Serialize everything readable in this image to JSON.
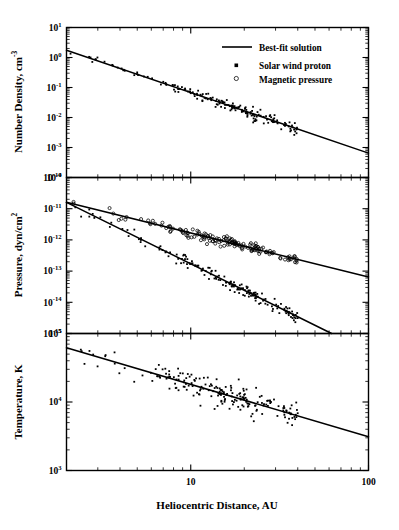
{
  "figure": {
    "title": "",
    "background_color": "#ffffff",
    "ink_color": "#000000"
  },
  "xaxis": {
    "label": "Heliocentric Distance,  AU",
    "scale": "log",
    "min": 2,
    "max": 100,
    "tick_labels": [
      "10",
      "100"
    ],
    "tick_values": [
      10,
      100
    ],
    "minor_ticks": [
      2,
      3,
      4,
      5,
      6,
      7,
      8,
      9,
      20,
      30,
      40,
      50,
      60,
      70,
      80,
      90
    ]
  },
  "legend": {
    "position": "top-right panel 1",
    "items": [
      {
        "label": "Best-fit solution",
        "marker": "line"
      },
      {
        "label": "Solar wind proton",
        "marker": "filled-square"
      },
      {
        "label": "Magnetic pressure",
        "marker": "open-circle"
      }
    ]
  },
  "chart_data": [
    {
      "type": "scatter",
      "panel": 1,
      "title": "",
      "xlabel": "Heliocentric Distance,  AU",
      "ylabel": "Number Density,  cm",
      "ylabel_sup": "-3",
      "xscale": "log",
      "yscale": "log",
      "xlim": [
        2,
        100
      ],
      "ylim": [
        0.0001,
        10
      ],
      "ytick_labels": [
        "10",
        "10",
        "10",
        "10",
        "10",
        "10"
      ],
      "ytick_sups": [
        "1",
        "0",
        "-1",
        "-2",
        "-3",
        "-4"
      ],
      "ytick_values": [
        10,
        1,
        0.1,
        0.01,
        0.001,
        0.0001
      ],
      "grid": false,
      "series": [
        {
          "name": "Best-fit solution",
          "type": "line",
          "x": [
            2,
            100
          ],
          "y": [
            1.75,
            0.00065
          ]
        },
        {
          "name": "Solar wind proton",
          "type": "scatter",
          "marker": "filled-square",
          "x": [
            2.1,
            2.4,
            2.5,
            3.0,
            3.3,
            3.5,
            3.8,
            4.0,
            4.2,
            4.4,
            4.6,
            4.8,
            5.0,
            5.2,
            5.4,
            5.6,
            5.8,
            6.0,
            6.2,
            6.4,
            6.6,
            6.8,
            7.0,
            7.2,
            7.4,
            7.6,
            7.8,
            8.0,
            8.2,
            8.5,
            8.8,
            9.0,
            9.2,
            9.5,
            9.8,
            10.0,
            10.3,
            10.6,
            10.9,
            11.2,
            11.5,
            11.8,
            12.1,
            12.4,
            12.7,
            13.0,
            13.4,
            13.8,
            14.2,
            14.6,
            15.0,
            15.4,
            15.8,
            16.2,
            16.6,
            17.0,
            17.5,
            18.0,
            18.5,
            19.0,
            19.5,
            20.0,
            20.5,
            21.0,
            21.5,
            22.0,
            22.5,
            23.0,
            23.5,
            24.0,
            24.5,
            25.0,
            25.5,
            26.0,
            26.5,
            27.0,
            27.5,
            28.0,
            28.5,
            29.0,
            29.5,
            30.0,
            30.5,
            31.0,
            31.5,
            32.0,
            32.5,
            33.0,
            33.5,
            34.0,
            34.5,
            35.0,
            35.5,
            36.0,
            36.5,
            37.0,
            37.5,
            38.0,
            38.5,
            39.0,
            39.5,
            40.0
          ],
          "y": [
            1.7,
            1.3,
            1.2,
            0.72,
            0.6,
            0.52,
            0.46,
            0.41,
            0.38,
            0.36,
            0.33,
            0.31,
            0.28,
            0.27,
            0.25,
            0.24,
            0.22,
            0.21,
            0.2,
            0.19,
            0.185,
            0.175,
            0.165,
            0.16,
            0.11,
            0.1,
            0.093,
            0.088,
            0.082,
            0.078,
            0.072,
            0.067,
            0.14,
            0.13,
            0.055,
            0.052,
            0.095,
            0.09,
            0.046,
            0.044,
            0.042,
            0.07,
            0.068,
            0.038,
            0.036,
            0.034,
            0.033,
            0.032,
            0.031,
            0.03,
            0.029,
            0.028,
            0.027,
            0.026,
            0.025,
            0.024,
            0.023,
            0.022,
            0.021,
            0.021,
            0.02,
            0.02,
            0.019,
            0.019,
            0.018,
            0.018,
            0.017,
            0.017,
            0.016,
            0.016,
            0.015,
            0.015,
            0.0145,
            0.014,
            0.0135,
            0.013,
            0.0125,
            0.012,
            0.0118,
            0.0115,
            0.011,
            0.0108,
            0.0105,
            0.0102,
            0.01,
            0.0098,
            0.0095,
            0.0092,
            0.009,
            0.0088,
            0.0085,
            0.0082,
            0.008,
            0.0078,
            0.0075,
            0.0072,
            0.007,
            0.0068,
            0.0065,
            0.0062,
            0.006
          ],
          "count": 102
        }
      ]
    },
    {
      "type": "scatter",
      "panel": 2,
      "title": "",
      "xlabel": "Heliocentric Distance,  AU",
      "ylabel": "Pressure,  dyn/cm",
      "ylabel_sup": "2",
      "xscale": "log",
      "yscale": "log",
      "xlim": [
        2,
        100
      ],
      "ylim": [
        1e-15,
        1e-10
      ],
      "ytick_labels": [
        "10",
        "10",
        "10",
        "10",
        "10",
        "10"
      ],
      "ytick_sups": [
        "-10",
        "-11",
        "-12",
        "-13",
        "-14",
        "-15"
      ],
      "ytick_values": [
        1e-10,
        1e-11,
        1e-12,
        1e-13,
        1e-14,
        1e-15
      ],
      "grid": false,
      "series": [
        {
          "name": "Best-fit solution (magnetic pressure)",
          "type": "line",
          "x": [
            2,
            100
          ],
          "y": [
            1.6e-11,
            6.5e-14
          ]
        },
        {
          "name": "Best-fit solution (proton pressure)",
          "type": "line",
          "x": [
            2,
            62
          ],
          "y": [
            1.6e-11,
            1e-15
          ]
        },
        {
          "name": "Magnetic pressure",
          "type": "scatter",
          "marker": "open-circle",
          "count": 130
        },
        {
          "name": "Solar wind proton",
          "type": "scatter",
          "marker": "filled-square",
          "count": 150
        }
      ]
    },
    {
      "type": "scatter",
      "panel": 3,
      "title": "",
      "xlabel": "Heliocentric Distance,  AU",
      "ylabel": "Temperature,  K",
      "ylabel_sup": "",
      "xscale": "log",
      "yscale": "log",
      "xlim": [
        2,
        100
      ],
      "ylim": [
        1000,
        100000
      ],
      "ytick_labels": [
        "10",
        "10",
        "10"
      ],
      "ytick_sups": [
        "5",
        "4",
        "3"
      ],
      "ytick_values": [
        100000,
        10000,
        1000
      ],
      "grid": false,
      "series": [
        {
          "name": "Best-fit solution",
          "type": "line",
          "x": [
            2,
            100
          ],
          "y": [
            62000,
            3100
          ]
        },
        {
          "name": "Solar wind proton",
          "type": "scatter",
          "marker": "filled-square",
          "count": 160
        }
      ]
    }
  ]
}
